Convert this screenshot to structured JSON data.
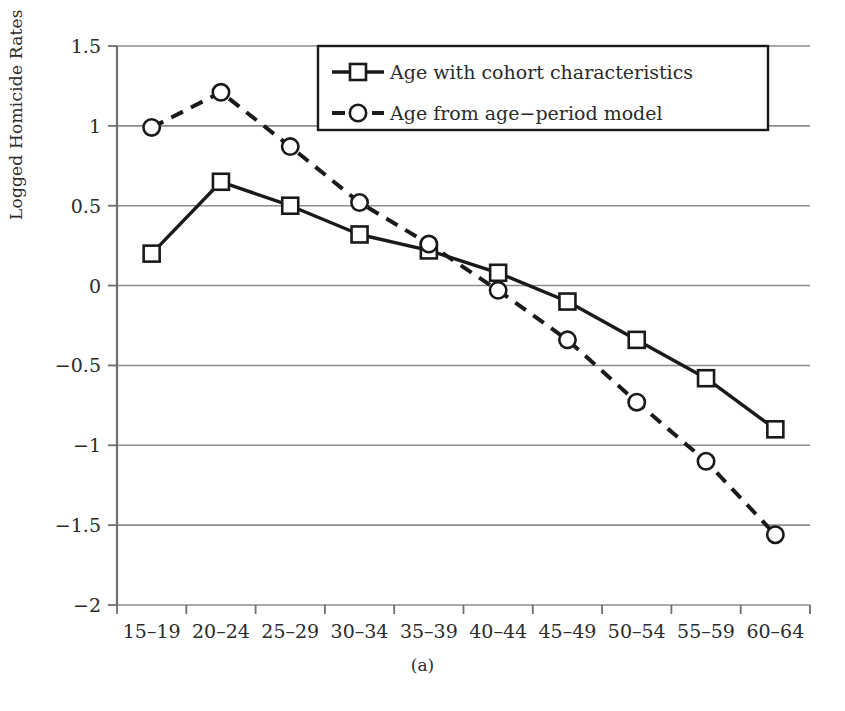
{
  "chart_data": {
    "type": "line",
    "title": "",
    "subtitle": "",
    "caption": "(a)",
    "xlabel": "",
    "ylabel": "Logged Homicide Rates",
    "categories": [
      "15–19",
      "20–24",
      "25–29",
      "30–34",
      "35–39",
      "40–44",
      "45–49",
      "50–54",
      "55–59",
      "60–64"
    ],
    "ylim": [
      -2,
      1.5
    ],
    "yticks": [
      1.5,
      1,
      0.5,
      0,
      -0.5,
      -1,
      -1.5,
      -2
    ],
    "ytick_labels": [
      "1.5",
      "1",
      "0.5",
      "0",
      "−0.5",
      "−1",
      "−1.5",
      "−2"
    ],
    "grid": "horizontal",
    "legend_position": "top-center",
    "series": [
      {
        "name": "Age with cohort characteristics",
        "marker": "square",
        "line_style": "solid",
        "color": "#1a1a1a",
        "values": [
          0.2,
          0.65,
          0.5,
          0.32,
          0.22,
          0.08,
          -0.1,
          -0.34,
          -0.58,
          -0.9
        ]
      },
      {
        "name": "Age from age−period model",
        "marker": "circle",
        "line_style": "dashed",
        "color": "#1a1a1a",
        "values": [
          0.99,
          1.21,
          0.87,
          0.52,
          0.26,
          -0.03,
          -0.34,
          -0.73,
          -1.1,
          -1.56
        ]
      }
    ]
  },
  "axis": {
    "line_color": "#6e6e6e",
    "grid_color": "#8c8c8c"
  },
  "legend": {
    "entries": [
      {
        "label": "Age with cohort characteristics"
      },
      {
        "label": "Age from age−period model"
      }
    ]
  }
}
